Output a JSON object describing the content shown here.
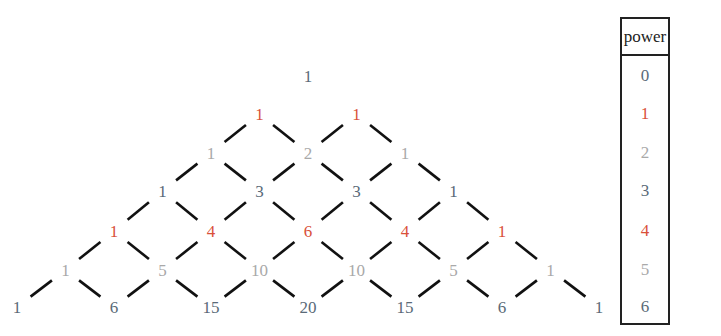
{
  "colors": {
    "c0": "#5a6a78",
    "c1": "#d9503a",
    "c2": "#a9a9a9",
    "line": "#111111"
  },
  "triangle": {
    "rows": [
      {
        "power": 0,
        "color": "c0",
        "values": [
          "1"
        ]
      },
      {
        "power": 1,
        "color": "c1",
        "values": [
          "1",
          "1"
        ]
      },
      {
        "power": 2,
        "color": "c2",
        "values": [
          "1",
          "2",
          "1"
        ]
      },
      {
        "power": 3,
        "color": "c0",
        "values": [
          "1",
          "3",
          "3",
          "1"
        ]
      },
      {
        "power": 4,
        "color": "c1",
        "values": [
          "1",
          "4",
          "6",
          "4",
          "1"
        ]
      },
      {
        "power": 5,
        "color": "c2",
        "values": [
          "1",
          "5",
          "10",
          "10",
          "5",
          "1"
        ]
      },
      {
        "power": 6,
        "color": "c0",
        "values": [
          "1",
          "6",
          "15",
          "20",
          "15",
          "6",
          "1"
        ]
      }
    ]
  },
  "power_table": {
    "header": "power",
    "rows": [
      {
        "label": "0",
        "color": "c0"
      },
      {
        "label": "1",
        "color": "c1"
      },
      {
        "label": "2",
        "color": "c2"
      },
      {
        "label": "3",
        "color": "c0"
      },
      {
        "label": "4",
        "color": "c1"
      },
      {
        "label": "5",
        "color": "c2"
      },
      {
        "label": "6",
        "color": "c0"
      }
    ]
  }
}
